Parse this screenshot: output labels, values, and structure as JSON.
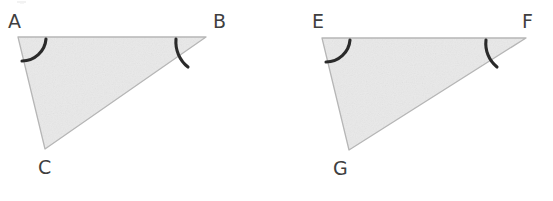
{
  "figure": {
    "background_color": "#ffffff",
    "fill_color": "#e9e9e9",
    "edge_color": "#b9b9b9",
    "mark_color": "#2b2b2b",
    "label_color": "#3f3f3f",
    "triangles": [
      {
        "name": "triangle-abc",
        "vertices": [
          {
            "label": "A",
            "x": 18,
            "y": 37,
            "label_x": 8,
            "label_y": 12
          },
          {
            "label": "B",
            "x": 206,
            "y": 37,
            "label_x": 213,
            "label_y": 12
          },
          {
            "label": "C",
            "x": 45,
            "y": 149,
            "label_x": 38,
            "label_y": 158
          }
        ],
        "angle_arcs": [
          {
            "name": "angle-arc-a",
            "vertex": "A"
          },
          {
            "name": "angle-arc-b",
            "vertex": "B"
          }
        ],
        "tick_marks": [
          {
            "name": "tick-mark-ab",
            "edge": "AB",
            "x": 112,
            "y_top": 24,
            "y_bottom": 52
          }
        ]
      },
      {
        "name": "triangle-efg",
        "vertices": [
          {
            "label": "E",
            "x": 322,
            "y": 38,
            "label_x": 312,
            "label_y": 12
          },
          {
            "label": "F",
            "x": 526,
            "y": 38,
            "label_x": 522,
            "label_y": 12
          },
          {
            "label": "G",
            "x": 349,
            "y": 150,
            "label_x": 333,
            "label_y": 159
          }
        ],
        "angle_arcs": [
          {
            "name": "angle-arc-e",
            "vertex": "E"
          },
          {
            "name": "angle-arc-f",
            "vertex": "F"
          }
        ],
        "tick_marks": [
          {
            "name": "tick-mark-ef",
            "edge": "EF",
            "x": 420,
            "y_top": 25,
            "y_bottom": 53
          }
        ]
      }
    ]
  },
  "labels": {
    "a": "A",
    "b": "B",
    "c": "C",
    "e": "E",
    "f": "F",
    "g": "G"
  }
}
